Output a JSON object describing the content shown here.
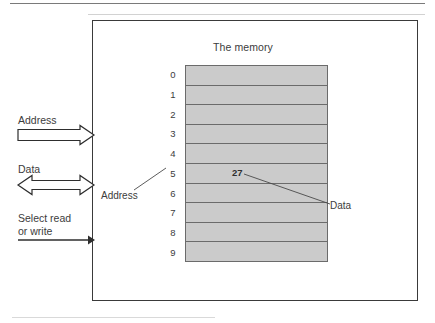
{
  "diagram": {
    "title": "The memory",
    "frame_border_color": "#3a3a3a",
    "cell_fill_color": "#cbcbcb",
    "cell_border_color": "#6b6b6b",
    "addresses": [
      "0",
      "1",
      "2",
      "3",
      "4",
      "5",
      "6",
      "7",
      "8",
      "9"
    ],
    "cells": [
      {
        "address": "0",
        "value": ""
      },
      {
        "address": "1",
        "value": ""
      },
      {
        "address": "2",
        "value": ""
      },
      {
        "address": "3",
        "value": ""
      },
      {
        "address": "4",
        "value": ""
      },
      {
        "address": "5",
        "value": "27"
      },
      {
        "address": "6",
        "value": ""
      },
      {
        "address": "7",
        "value": ""
      },
      {
        "address": "8",
        "value": ""
      },
      {
        "address": "9",
        "value": ""
      }
    ],
    "callouts": {
      "address": "Address",
      "data": "Data"
    },
    "signals": [
      {
        "label": "Address",
        "arrow": "hollow-right-arrow"
      },
      {
        "label": "Data",
        "arrow": "hollow-double-arrow"
      },
      {
        "label": "Select read\nor write",
        "line1": "Select read",
        "line2": "or write",
        "arrow": "thin-right-arrow"
      }
    ]
  }
}
